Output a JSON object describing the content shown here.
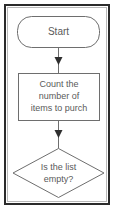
{
  "diagram": {
    "type": "flowchart",
    "orientation": "vertical",
    "frame": {
      "border_color": "#2b2b2b",
      "inner_rule_color": "#b9b9b9",
      "background": "#ffffff"
    },
    "style": {
      "shape_fill": "#ffffff",
      "shape_stroke": "#6e6e6e",
      "text_color": "#5a5a5a",
      "arrow_color": "#2f2f2f"
    },
    "nodes": [
      {
        "id": "start",
        "shape": "rounded-rectangle",
        "role": "terminator",
        "lines": [
          "Start"
        ]
      },
      {
        "id": "count-items",
        "shape": "rectangle",
        "role": "process",
        "lines": [
          "Count the",
          "number of",
          "items to purch"
        ]
      },
      {
        "id": "is-list-empty",
        "shape": "diamond",
        "role": "decision",
        "lines": [
          "Is the list",
          "empty?"
        ]
      }
    ],
    "connectors": [
      {
        "id": "start-to-count",
        "from": "start",
        "to": "count-items",
        "label": "",
        "arrowhead": "solid-triangle"
      },
      {
        "id": "count-to-decision",
        "from": "count-items",
        "to": "is-list-empty",
        "label": "",
        "arrowhead": "solid-triangle"
      }
    ]
  }
}
